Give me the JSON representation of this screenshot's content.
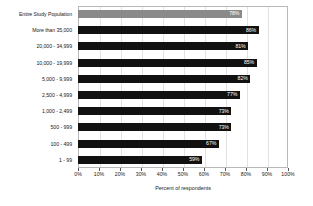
{
  "chart_data": {
    "type": "bar",
    "orientation": "horizontal",
    "title": "",
    "xlabel": "Percent of respondents",
    "ylabel": "",
    "xlim": [
      0,
      100
    ],
    "xticks": [
      "0%",
      "10%",
      "20%",
      "30%",
      "40%",
      "50%",
      "60%",
      "70%",
      "80%",
      "90%",
      "100%"
    ],
    "xtick_values": [
      0,
      10,
      20,
      30,
      40,
      50,
      60,
      70,
      80,
      90,
      100
    ],
    "grid": "vertical",
    "legend": "none",
    "categories": [
      "Entire Study Population",
      "More than 35,000",
      "20,000 - 34,999",
      "10,000 - 19,999",
      "5,000 - 9,999",
      "2,500 - 4,999",
      "1,000 - 2,499",
      "500 - 999",
      "100 - 499",
      "1 - 99"
    ],
    "values": [
      78,
      86,
      81,
      85,
      82,
      77,
      73,
      73,
      67,
      59
    ],
    "data_labels": [
      "78%",
      "86%",
      "81%",
      "85%",
      "82%",
      "77%",
      "73%",
      "73%",
      "67%",
      "59%"
    ],
    "bar_colors": [
      "#8a8a8a",
      "#111111",
      "#111111",
      "#111111",
      "#111111",
      "#111111",
      "#111111",
      "#111111",
      "#111111",
      "#111111"
    ],
    "highlight_index": 0
  },
  "colors": {
    "bar_primary": "#111111",
    "bar_highlight": "#8a8a8a",
    "data_label": "#ffffff",
    "axis_text": "#1a1a1a",
    "gridline": "#e2e2e2",
    "frame": "#b8b8b8",
    "background": "#ffffff"
  }
}
